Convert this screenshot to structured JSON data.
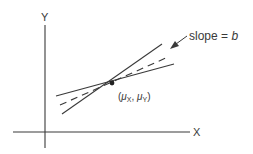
{
  "diagram": {
    "y_axis_label": "Y",
    "x_axis_label": "X",
    "slope_label_prefix": "slope = ",
    "slope_label_var": "b",
    "point_label": {
      "open": "(",
      "mu1": "μ",
      "sub1": "X",
      "sep": ", ",
      "mu2": "μ",
      "sub2": "Y",
      "close": ")"
    },
    "colors": {
      "ink": "#3a3a3a",
      "background": "#ffffff"
    },
    "elements": {
      "axes": "Cartesian X-Y axes",
      "lines": [
        "steep solid line",
        "shallow solid line",
        "dashed regression line (slope b)"
      ],
      "point": "mean point (μX, μY)"
    }
  }
}
